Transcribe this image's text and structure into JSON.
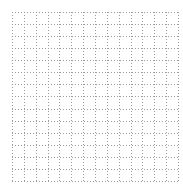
{
  "grid": {
    "background": "#ffffff",
    "line_color": "#9a9a9a",
    "line_style": "dotted",
    "origin_x": 12,
    "origin_y": 12,
    "columns": 14,
    "rows": 14,
    "cell_width": 11.86,
    "cell_height": 12.07,
    "dot_dash": "1,2"
  }
}
